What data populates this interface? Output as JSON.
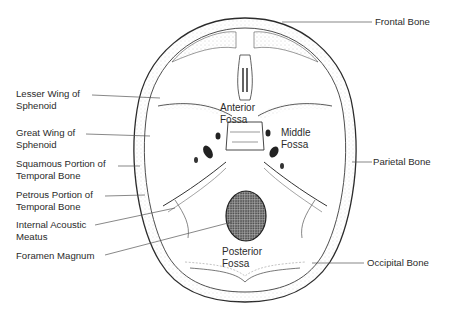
{
  "diagram": {
    "left_labels": [
      {
        "line1": "Lesser Wing of",
        "line2": "Sphenoid"
      },
      {
        "line1": "Great Wing of",
        "line2": "Sphenoid"
      },
      {
        "line1": "Squamous Portion of",
        "line2": "Temporal Bone"
      },
      {
        "line1": "Petrous Portion of",
        "line2": "Temporal Bone"
      },
      {
        "line1": "Internal Acoustic",
        "line2": "Meatus"
      },
      {
        "line1": "Foramen Magnum",
        "line2": ""
      }
    ],
    "right_labels": [
      {
        "text": "Frontal Bone"
      },
      {
        "text": "Parietal Bone"
      },
      {
        "text": "Occipital Bone"
      }
    ],
    "inner_labels": {
      "anterior": {
        "line1": "Anterior",
        "line2": "Fossa"
      },
      "middle": {
        "line1": "Middle",
        "line2": "Fossa"
      },
      "posterior": {
        "line1": "Posterior",
        "line2": "Fossa"
      }
    },
    "colors": {
      "line": "#2a2a2a",
      "stipple": "#8a8a8a",
      "foramen_fill": "#6a6a6a",
      "background": "#ffffff"
    }
  }
}
